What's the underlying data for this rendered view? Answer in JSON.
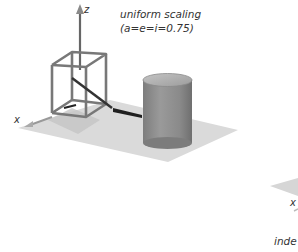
{
  "figure": {
    "left_panel": {
      "caption_line1": "uniform scaling",
      "caption_line2": "(a=e=i=0.75)",
      "axes": {
        "z_label": "z",
        "x_label": "x"
      },
      "objects": [
        "wireframe-cube",
        "cylinder",
        "ground-plane"
      ]
    },
    "right_panel": {
      "axes": {
        "x_label": "x"
      },
      "caption_partial": "inde"
    },
    "colors": {
      "ground": "#d9d9d9",
      "cube_edge": "#7a7a7a",
      "cylinder_body": "#8e8e8e",
      "cylinder_top": "#b5b5b5",
      "shadow": "#1f1f1f",
      "axis": "#555555",
      "text": "#333333"
    }
  }
}
